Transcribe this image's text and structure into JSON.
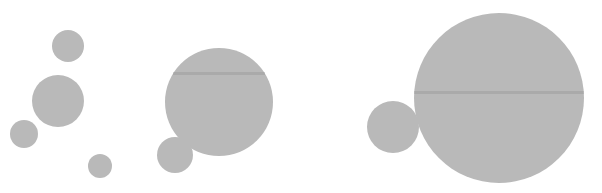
{
  "canvas": {
    "width": 602,
    "height": 193,
    "background": "#ffffff"
  },
  "colors": {
    "fill": "#b9b9b9",
    "streak": "#8f8f8f"
  },
  "groups": [
    {
      "name": "left-cluster",
      "circles": [
        {
          "cx": 68,
          "cy": 46,
          "r": 16
        },
        {
          "cx": 58,
          "cy": 101,
          "r": 26
        },
        {
          "cx": 24,
          "cy": 134,
          "r": 14
        },
        {
          "cx": 100,
          "cy": 166,
          "r": 12
        }
      ]
    },
    {
      "name": "middle-cluster",
      "circles": [
        {
          "cx": 219,
          "cy": 102,
          "r": 54,
          "streak_y": 73
        },
        {
          "cx": 175,
          "cy": 155,
          "r": 18
        }
      ]
    },
    {
      "name": "right-cluster",
      "circles": [
        {
          "cx": 499,
          "cy": 98,
          "r": 85,
          "streak_y": 92
        },
        {
          "cx": 393,
          "cy": 127,
          "r": 26
        }
      ]
    }
  ]
}
